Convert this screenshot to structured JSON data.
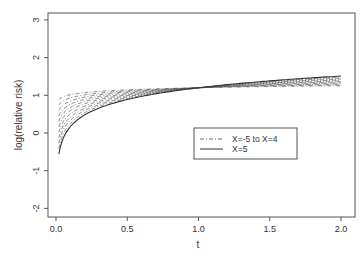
{
  "chart_data": {
    "type": "line",
    "title": "",
    "xlabel": "t",
    "ylabel": "log(relative risk)",
    "xlim": [
      0.0,
      2.0
    ],
    "ylim": [
      -2,
      3
    ],
    "x_ticks": [
      "0.0",
      "0.5",
      "1.0",
      "1.5",
      "2.0"
    ],
    "y_ticks": [
      "-2",
      "-1",
      "0",
      "1",
      "2",
      "3"
    ],
    "grid": false,
    "legend_position": "inside right-center",
    "legend": [
      "X=-5 to X=4",
      "X=5"
    ],
    "x": [
      0.02,
      0.05,
      0.1,
      0.2,
      0.3,
      0.5,
      0.75,
      1.0,
      1.25,
      1.5,
      1.75,
      2.0
    ],
    "series": [
      {
        "name": "X=-5",
        "style": "dashed",
        "values": [
          0.89,
          1.0,
          1.06,
          1.11,
          1.14,
          1.17,
          1.19,
          1.2,
          1.21,
          1.22,
          1.23,
          1.24
        ]
      },
      {
        "name": "X=-4",
        "style": "dashed",
        "values": [
          0.74,
          0.89,
          0.97,
          1.05,
          1.1,
          1.14,
          1.18,
          1.2,
          1.22,
          1.23,
          1.24,
          1.25
        ]
      },
      {
        "name": "X=-3",
        "style": "dashed",
        "values": [
          0.59,
          0.78,
          0.89,
          0.99,
          1.05,
          1.11,
          1.16,
          1.2,
          1.23,
          1.25,
          1.27,
          1.29
        ]
      },
      {
        "name": "X=-2",
        "style": "dashed",
        "values": [
          0.44,
          0.67,
          0.81,
          0.93,
          1.01,
          1.09,
          1.15,
          1.2,
          1.24,
          1.27,
          1.3,
          1.32
        ]
      },
      {
        "name": "X=-1",
        "style": "dashed",
        "values": [
          0.29,
          0.56,
          0.72,
          0.88,
          0.97,
          1.06,
          1.14,
          1.2,
          1.25,
          1.29,
          1.32,
          1.35
        ]
      },
      {
        "name": "X=0",
        "style": "dashed",
        "values": [
          0.14,
          0.45,
          0.63,
          0.82,
          0.93,
          1.04,
          1.13,
          1.2,
          1.25,
          1.3,
          1.34,
          1.37
        ]
      },
      {
        "name": "X=1",
        "style": "dashed",
        "values": [
          -0.01,
          0.34,
          0.55,
          0.76,
          0.88,
          1.03,
          1.12,
          1.2,
          1.26,
          1.31,
          1.35,
          1.39
        ]
      },
      {
        "name": "X=2",
        "style": "dashed",
        "values": [
          -0.16,
          0.23,
          0.46,
          0.69,
          0.83,
          1.01,
          1.11,
          1.2,
          1.27,
          1.32,
          1.37,
          1.41
        ]
      },
      {
        "name": "X=3",
        "style": "dashed",
        "values": [
          -0.31,
          0.12,
          0.37,
          0.62,
          0.78,
          0.99,
          1.1,
          1.2,
          1.28,
          1.34,
          1.39,
          1.44
        ]
      },
      {
        "name": "X=4",
        "style": "dashed",
        "values": [
          -0.46,
          0.01,
          0.28,
          0.55,
          0.72,
          0.95,
          1.09,
          1.2,
          1.29,
          1.36,
          1.42,
          1.47
        ]
      },
      {
        "name": "X=5",
        "style": "solid",
        "values": [
          -0.56,
          -0.15,
          0.16,
          0.48,
          0.66,
          0.89,
          1.07,
          1.2,
          1.3,
          1.38,
          1.45,
          1.51
        ]
      }
    ]
  }
}
